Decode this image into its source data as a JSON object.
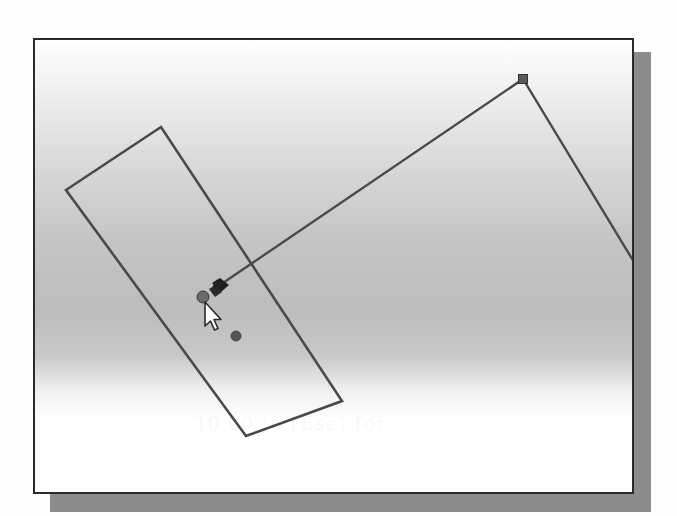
{
  "canvas": {
    "description": "CAD sketch viewport with a rotated rectangle and a polyline being drawn",
    "background_gradient": [
      "#ffffff",
      "#d6d6d6",
      "#bdbdbd",
      "#ffffff"
    ],
    "frame_border_color": "#2a2a2a",
    "shadow_color": "#8c8c8c",
    "line_color": "#4a4a4a",
    "marker_color": "#555555"
  },
  "sketch": {
    "rectangle": {
      "name": "rotated-rectangle",
      "corners": [
        [
          161,
          127
        ],
        [
          66,
          190
        ],
        [
          246,
          436
        ],
        [
          342,
          401
        ]
      ]
    },
    "polyline": {
      "name": "sketch-line",
      "points": [
        [
          220,
          285
        ],
        [
          523,
          79
        ],
        [
          634,
          262
        ]
      ]
    },
    "vertex_marker": {
      "x": 523,
      "y": 79,
      "size": 9,
      "shape": "square"
    },
    "endpoint_marker": {
      "x": 203,
      "y": 297,
      "r": 6,
      "shape": "circle"
    },
    "snap_glyph": {
      "x": 216,
      "y": 287,
      "shape": "diamond-cluster"
    },
    "point": {
      "x": 236,
      "y": 336,
      "r": 5
    }
  },
  "cursor": {
    "icon": "arrow-pointer-icon",
    "x": 205,
    "y": 302
  },
  "ghost_text": "10.00 in [Esc] for"
}
